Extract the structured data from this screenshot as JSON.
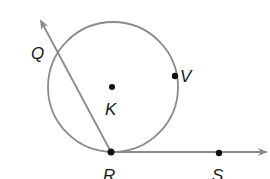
{
  "diagram": {
    "type": "circle-tangent-secant",
    "colors": {
      "line": "#8a8a8a",
      "point": "#111111",
      "label": "#1a1a1a",
      "background": "#ffffff"
    },
    "circle": {
      "name": "K",
      "cx": 113,
      "cy": 87,
      "r": 65
    },
    "points": [
      {
        "id": "K",
        "label": "K",
        "x": 112,
        "y": 87,
        "label_x": 106,
        "label_y": 115
      },
      {
        "id": "V",
        "label": "V",
        "x": 175,
        "y": 76,
        "label_x": 180,
        "label_y": 82
      },
      {
        "id": "R",
        "label": "R",
        "x": 111,
        "y": 152,
        "label_x": 104,
        "label_y": 179
      },
      {
        "id": "S",
        "label": "S",
        "x": 219,
        "y": 153,
        "label_x": 213,
        "label_y": 179
      },
      {
        "id": "Q",
        "label": "Q",
        "x": 55,
        "y": 48,
        "label_x": 32,
        "label_y": 59
      }
    ],
    "rays": [
      {
        "name": "ray-RQ",
        "from": "R",
        "to_x": 40,
        "to_y": 19
      },
      {
        "name": "ray-RS",
        "from": "R",
        "to_x": 268,
        "to_y": 153
      }
    ]
  }
}
